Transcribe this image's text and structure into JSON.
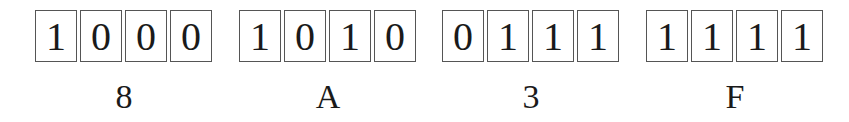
{
  "diagram": {
    "type": "binary-to-hex nibble groups",
    "groups": [
      {
        "bits": [
          "1",
          "0",
          "0",
          "0"
        ],
        "hex": "8"
      },
      {
        "bits": [
          "1",
          "0",
          "1",
          "0"
        ],
        "hex": "A"
      },
      {
        "bits": [
          "0",
          "1",
          "1",
          "1"
        ],
        "hex": "3"
      },
      {
        "bits": [
          "1",
          "1",
          "1",
          "1"
        ],
        "hex": "F"
      }
    ],
    "colors": {
      "border": "#555555",
      "text": "#1a1a1a",
      "background": "#ffffff"
    }
  }
}
